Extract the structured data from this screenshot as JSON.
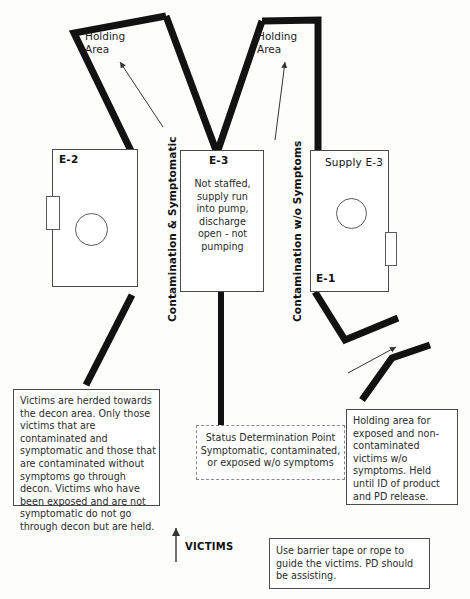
{
  "diagram": {
    "colors": {
      "barrier": "#121212",
      "box_outline": "#4a4a4a",
      "dashed_outline": "#8a8a8a",
      "text": "#1a1a1a",
      "background": "#ffffff"
    }
  },
  "holding_areas": [
    {
      "name": "holding-area-left",
      "label": "Holding\nArea"
    },
    {
      "name": "holding-area-right",
      "label": "Holding\nArea"
    }
  ],
  "corridors": [
    {
      "name": "corridor-contaminated-symptomatic",
      "label": "Contamination & Symptomatic"
    },
    {
      "name": "corridor-contaminated-no-symptoms",
      "label": "Contamination w/o Symptoms"
    }
  ],
  "apparatus": [
    {
      "name": "apparatus-e2",
      "label": "E-2",
      "label_style": "bold",
      "body": ""
    },
    {
      "name": "apparatus-e3",
      "label": "E-3",
      "label_style": "bold",
      "body": "Not staffed,\nsupply run\ninto pump,\ndischarge\nopen - not\npumping"
    },
    {
      "name": "apparatus-supply-e3",
      "label": "Supply E-3",
      "label_style": "plain",
      "secondary_label": "E-1",
      "body": ""
    }
  ],
  "notes": [
    {
      "name": "note-victims-herded",
      "text": "Victims are herded towards the decon area. Only those victims that are contaminated and symptomatic and those that are contaminated without symptoms go through decon. Victims who have been exposed and are not symptomatic do not go through decon but are held."
    },
    {
      "name": "note-status-determination-point",
      "text": "Status Determination Point\nSymptomatic, contaminated,\nor exposed w/o symptoms",
      "style": "dashed"
    },
    {
      "name": "note-holding-area-detail",
      "text": "Holding area for exposed and non-contaminated victims w/o symptoms. Held until ID of product and PD release."
    },
    {
      "name": "note-barrier-tape",
      "text": "Use barrier tape or rope to guide the victims. PD should be assisting."
    }
  ],
  "flow": {
    "victims_label": "VICTIMS"
  }
}
